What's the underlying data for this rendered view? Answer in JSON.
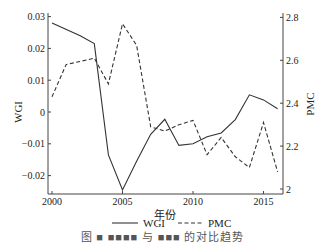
{
  "chart_data": {
    "type": "line",
    "title": "",
    "xlabel": "年份",
    "ylabel_left": "WGI",
    "ylabel_right": "PMC",
    "xlim": [
      2000,
      2016.5
    ],
    "ylim_left": [
      -0.025,
      0.031
    ],
    "ylim_right": [
      1.98,
      2.84
    ],
    "x_ticks": [
      2000,
      2005,
      2010,
      2015
    ],
    "y_ticks_left": [
      0.03,
      0.02,
      0.01,
      0,
      -0.01,
      -0.02
    ],
    "y_ticks_left_labels": [
      "0.03",
      "0.02",
      "0.01",
      "0",
      "−0.01",
      "−0.02"
    ],
    "y_ticks_right": [
      2.8,
      2.6,
      2.4,
      2.2,
      2
    ],
    "y_ticks_right_labels": [
      "2.8",
      "2.6",
      "2.4",
      "2.2",
      "2"
    ],
    "grid": false,
    "legend_position": "bottom",
    "series": [
      {
        "name": "WGI",
        "axis": "left",
        "style": "solid",
        "x": [
          2000,
          2002,
          2003,
          2004,
          2005,
          2006,
          2007,
          2008,
          2009,
          2010,
          2011,
          2012,
          2013,
          2014,
          2015,
          2016
        ],
        "values": [
          0.028,
          0.024,
          0.0215,
          -0.0135,
          -0.0245,
          -0.0155,
          -0.007,
          -0.0023,
          -0.0105,
          -0.01,
          -0.0078,
          -0.0066,
          -0.0024,
          0.0054,
          0.0038,
          0.001
        ]
      },
      {
        "name": "PMC",
        "axis": "right",
        "style": "dashed",
        "x": [
          2000,
          2001,
          2003,
          2004,
          2005,
          2006,
          2007,
          2008,
          2009,
          2010,
          2011,
          2012,
          2013,
          2014,
          2015,
          2016
        ],
        "values": [
          2.43,
          2.58,
          2.61,
          2.49,
          2.77,
          2.67,
          2.29,
          2.27,
          2.3,
          2.32,
          2.16,
          2.24,
          2.15,
          2.1,
          2.31,
          2.08
        ]
      }
    ]
  },
  "legend": {
    "items": [
      {
        "label": "WGI",
        "style": "solid"
      },
      {
        "label": "PMC",
        "style": "dashed"
      }
    ]
  },
  "caption": "图 ■ ■■■■ 与 ■■■ 的对比趋势",
  "colors": {
    "line": "#333333",
    "axis": "#444444"
  }
}
